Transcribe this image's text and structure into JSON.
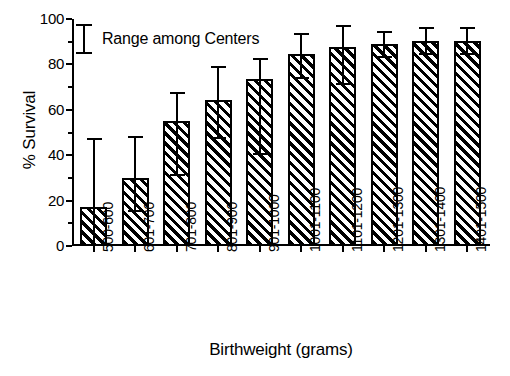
{
  "chart_data": {
    "type": "bar",
    "title": "",
    "xlabel": "Birthweight (grams)",
    "ylabel": "% Survival",
    "ylim": [
      0,
      100
    ],
    "yticks": [
      0,
      20,
      40,
      60,
      80,
      100
    ],
    "ytick_labels": [
      "0",
      "20",
      "40",
      "60",
      "80",
      "100"
    ],
    "grid": false,
    "legend_position": "top-left",
    "legend": [
      {
        "label": "Range among Centers",
        "symbol": "error-bar-i-beam"
      }
    ],
    "error_bar_note": "Whiskers show range among centers (low to high)",
    "categories": [
      "500-600",
      "601-700",
      "701-800",
      "801-900",
      "901-1000",
      "1001-1100",
      "1101-1200",
      "1201-1300",
      "1301-1400",
      "1401-1500"
    ],
    "values": [
      17,
      30,
      55,
      64.5,
      73.5,
      84.5,
      87.5,
      89,
      90.5,
      90.5
    ],
    "err_high": [
      46.5,
      47.5,
      67,
      78.5,
      82,
      93,
      96.5,
      94,
      95.5,
      95.5
    ],
    "err_low": [
      0,
      15,
      31,
      47,
      40,
      73.5,
      71,
      83,
      84,
      84
    ],
    "series": [
      {
        "name": "% Survival",
        "values": [
          17,
          30,
          55,
          64.5,
          73.5,
          84.5,
          87.5,
          89,
          90.5,
          90.5
        ]
      }
    ]
  },
  "axes": {
    "y_title": "% Survival",
    "x_title": "Birthweight (grams)"
  },
  "legend": {
    "label": "Range among Centers"
  }
}
